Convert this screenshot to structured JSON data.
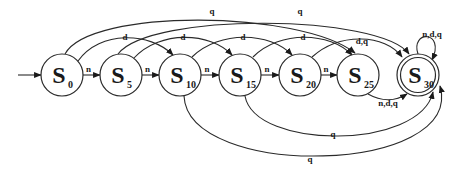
{
  "diagram": {
    "type": "finite-state-machine",
    "initial_state": "S0",
    "accepting_states": [
      "S30"
    ],
    "states": [
      {
        "id": "S0",
        "letter": "S",
        "subscript": "0"
      },
      {
        "id": "S5",
        "letter": "S",
        "subscript": "5"
      },
      {
        "id": "S10",
        "letter": "S",
        "subscript": "10"
      },
      {
        "id": "S15",
        "letter": "S",
        "subscript": "15"
      },
      {
        "id": "S20",
        "letter": "S",
        "subscript": "20"
      },
      {
        "id": "S25",
        "letter": "S",
        "subscript": "25"
      },
      {
        "id": "S30",
        "letter": "S",
        "subscript": "30"
      }
    ],
    "transitions": [
      {
        "from": "S0",
        "to": "S5",
        "label": "n"
      },
      {
        "from": "S5",
        "to": "S10",
        "label": "n"
      },
      {
        "from": "S10",
        "to": "S15",
        "label": "n"
      },
      {
        "from": "S15",
        "to": "S20",
        "label": "n"
      },
      {
        "from": "S20",
        "to": "S25",
        "label": "n"
      },
      {
        "from": "S0",
        "to": "S10",
        "label": "d"
      },
      {
        "from": "S5",
        "to": "S15",
        "label": "d"
      },
      {
        "from": "S10",
        "to": "S20",
        "label": "d"
      },
      {
        "from": "S15",
        "to": "S25",
        "label": "d"
      },
      {
        "from": "S20",
        "to": "S30",
        "label": "d,q"
      },
      {
        "from": "S0",
        "to": "S25",
        "label": "q"
      },
      {
        "from": "S5",
        "to": "S30",
        "label": "q"
      },
      {
        "from": "S25",
        "to": "S30",
        "label": "n,d,q"
      },
      {
        "from": "S15",
        "to": "S30",
        "label": "q"
      },
      {
        "from": "S10",
        "to": "S30",
        "label": "q"
      },
      {
        "from": "S30",
        "to": "S30",
        "label": "n,d,q"
      }
    ]
  }
}
